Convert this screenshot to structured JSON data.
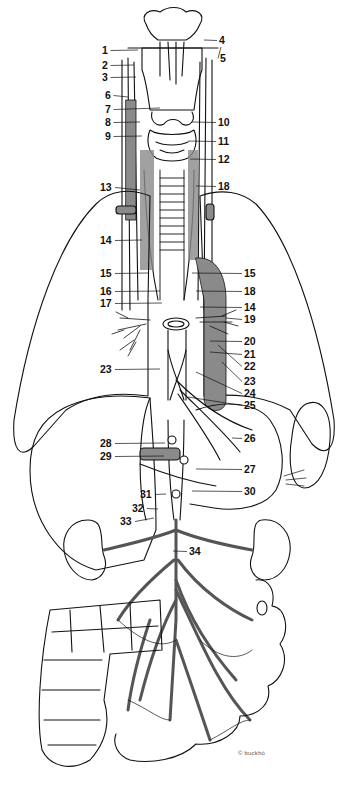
{
  "figure": {
    "type": "anatomical line drawing",
    "colors": {
      "line": "#111111",
      "shade": "#8a8a8a",
      "background": "#ffffff"
    }
  },
  "labels": [
    {
      "n": "1",
      "x": 102,
      "y": 45,
      "side": "left",
      "tx": 138,
      "ty": 50
    },
    {
      "n": "2",
      "x": 102,
      "y": 60,
      "side": "left",
      "tx": 134,
      "ty": 65
    },
    {
      "n": "3",
      "x": 102,
      "y": 72,
      "side": "left",
      "tx": 136,
      "ty": 77
    },
    {
      "n": "4",
      "x": 219,
      "y": 35,
      "side": "right",
      "tx": 204,
      "ty": 40
    },
    {
      "n": "5",
      "x": 220,
      "y": 53,
      "side": "right",
      "tx": 221,
      "ty": 47
    },
    {
      "n": "6",
      "x": 105,
      "y": 90,
      "side": "left",
      "tx": 128,
      "ty": 97
    },
    {
      "n": "7",
      "x": 105,
      "y": 104,
      "side": "left",
      "tx": 160,
      "ty": 108
    },
    {
      "n": "8",
      "x": 105,
      "y": 117,
      "side": "left",
      "tx": 140,
      "ty": 122
    },
    {
      "n": "9",
      "x": 105,
      "y": 131,
      "side": "left",
      "tx": 142,
      "ty": 136
    },
    {
      "n": "10",
      "x": 218,
      "y": 117,
      "side": "right",
      "tx": 192,
      "ty": 122
    },
    {
      "n": "11",
      "x": 218,
      "y": 136,
      "side": "right",
      "tx": 188,
      "ty": 141
    },
    {
      "n": "12",
      "x": 218,
      "y": 154,
      "side": "right",
      "tx": 190,
      "ty": 159
    },
    {
      "n": "13",
      "x": 100,
      "y": 182,
      "side": "left",
      "tx": 140,
      "ty": 190
    },
    {
      "n": "14",
      "x": 100,
      "y": 235,
      "side": "left",
      "tx": 142,
      "ty": 240
    },
    {
      "n": "15",
      "x": 100,
      "y": 268,
      "side": "left",
      "tx": 148,
      "ty": 273
    },
    {
      "n": "16",
      "x": 100,
      "y": 286,
      "side": "left",
      "tx": 160,
      "ty": 291
    },
    {
      "n": "17",
      "x": 100,
      "y": 298,
      "side": "left",
      "tx": 162,
      "ty": 303
    },
    {
      "n": "18",
      "x": 218,
      "y": 181,
      "side": "right",
      "tx": 196,
      "ty": 186
    },
    {
      "n": "15",
      "x": 244,
      "y": 268,
      "side": "right",
      "tx": 192,
      "ty": 273
    },
    {
      "n": "18",
      "x": 244,
      "y": 286,
      "side": "right",
      "tx": 196,
      "ty": 291
    },
    {
      "n": "14",
      "x": 244,
      "y": 302,
      "side": "right",
      "tx": 200,
      "ty": 307
    },
    {
      "n": "19",
      "x": 244,
      "y": 314,
      "side": "right",
      "tx": 226,
      "ty": 318
    },
    {
      "n": "20",
      "x": 244,
      "y": 336,
      "side": "right",
      "tx": 210,
      "ty": 341
    },
    {
      "n": "21",
      "x": 244,
      "y": 349,
      "side": "right",
      "tx": 210,
      "ty": 352
    },
    {
      "n": "22",
      "x": 244,
      "y": 361,
      "side": "right",
      "tx": 218,
      "ty": 345
    },
    {
      "n": "23",
      "x": 100,
      "y": 364,
      "side": "left",
      "tx": 160,
      "ty": 369
    },
    {
      "n": "23",
      "x": 244,
      "y": 376,
      "side": "right",
      "tx": 222,
      "ty": 362
    },
    {
      "n": "24",
      "x": 244,
      "y": 388,
      "side": "right",
      "tx": 196,
      "ty": 372
    },
    {
      "n": "25",
      "x": 244,
      "y": 400,
      "side": "right",
      "tx": 188,
      "ty": 397
    },
    {
      "n": "26",
      "x": 244,
      "y": 433,
      "side": "right",
      "tx": 232,
      "ty": 438
    },
    {
      "n": "27",
      "x": 244,
      "y": 464,
      "side": "right",
      "tx": 196,
      "ty": 469
    },
    {
      "n": "28",
      "x": 100,
      "y": 438,
      "side": "left",
      "tx": 165,
      "ty": 443
    },
    {
      "n": "29",
      "x": 100,
      "y": 451,
      "side": "left",
      "tx": 164,
      "ty": 456
    },
    {
      "n": "30",
      "x": 244,
      "y": 486,
      "side": "right",
      "tx": 192,
      "ty": 491
    },
    {
      "n": "31",
      "x": 140,
      "y": 489,
      "side": "left",
      "tx": 166,
      "ty": 494
    },
    {
      "n": "32",
      "x": 132,
      "y": 503,
      "side": "left",
      "tx": 158,
      "ty": 509
    },
    {
      "n": "33",
      "x": 120,
      "y": 516,
      "side": "left",
      "tx": 154,
      "ty": 518
    },
    {
      "n": "34",
      "x": 189,
      "y": 546,
      "side": "right",
      "tx": 173,
      "ty": 551
    }
  ],
  "signature": "© buckhö"
}
